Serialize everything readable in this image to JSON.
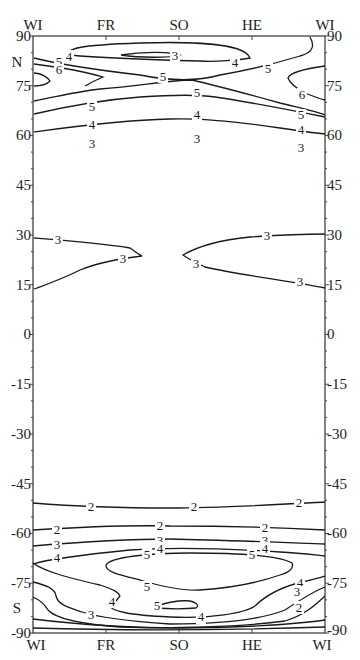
{
  "chart_data": {
    "type": "contour",
    "title": "",
    "xlabel": "",
    "ylabel": "",
    "x_ticks": [
      "WI",
      "FR",
      "SO",
      "HE",
      "WI"
    ],
    "y_ticks": [
      90,
      75,
      60,
      45,
      30,
      15,
      0,
      -15,
      -30,
      -45,
      -60,
      -75,
      -90
    ],
    "y_range": [
      -90,
      90
    ],
    "hemisphere_labels": {
      "north": "N",
      "south": "S"
    },
    "grid": false,
    "contour_levels": [
      2,
      3,
      4,
      5,
      6
    ],
    "contours": [
      {
        "level": 3,
        "region": "north polar closed minimum near SO at ~83N"
      },
      {
        "level": 4,
        "region": "north polar closed loop FR-HE ~80-86N"
      },
      {
        "level": 5,
        "region": "north WI to HE ~82N"
      },
      {
        "level": 6,
        "region": "north WI left ~78N"
      },
      {
        "level": 6,
        "region": "north WI right ~75N"
      },
      {
        "level": 5,
        "region": "north ~70N across year"
      },
      {
        "level": 4,
        "region": "north ~62-66N across year"
      },
      {
        "level": 3,
        "region": "north ~55-59N across year"
      },
      {
        "level": 3,
        "region": "tropical WI-FR 15-30N"
      },
      {
        "level": 3,
        "region": "tropical SO-WI 15-30N"
      },
      {
        "level": 2,
        "region": "south ~-52S across year"
      },
      {
        "level": 2,
        "region": "south ~-59S across year"
      },
      {
        "level": 3,
        "region": "south ~-63S across year"
      },
      {
        "level": 4,
        "region": "south ~-66S across year"
      },
      {
        "level": 5,
        "region": "south polar closed loop ~-70 to -78S"
      },
      {
        "level": 5,
        "region": "south small closed loop near SO ~-83S"
      },
      {
        "level": 4,
        "region": "south ~-78 to -85S"
      },
      {
        "level": 3,
        "region": "south ~-76 to -86S"
      },
      {
        "level": 2,
        "region": "south ~-80 to -88S"
      }
    ]
  },
  "axes": {
    "top_months": [
      "WI",
      "FR",
      "SO",
      "HE",
      "WI"
    ],
    "bottom_months": [
      "WI",
      "FR",
      "SO",
      "HE",
      "WI"
    ],
    "left_ticks": [
      "90",
      "75",
      "60",
      "45",
      "30",
      "15",
      "0",
      "-15",
      "-30",
      "-45",
      "-60",
      "-75",
      "-90"
    ],
    "right_ticks": [
      "90",
      "75",
      "60",
      "45",
      "30",
      "15",
      "0",
      "-15",
      "-30",
      "-45",
      "-60",
      "-75",
      "-90"
    ],
    "north_label": "N",
    "south_label": "S"
  },
  "labels": {
    "n3": "3",
    "n4a": "4",
    "n4b": "4",
    "n5a": "5",
    "n5b": "5",
    "n5c": "5",
    "n6a": "6",
    "n6b": "6",
    "m5a": "5",
    "m5b": "5",
    "m5c": "5",
    "m4a": "4",
    "m4b": "4",
    "m4c": "4",
    "m3a": "3",
    "m3b": "3",
    "m3c": "3",
    "t3a": "3",
    "t3b": "3",
    "t3c": "3",
    "t3d": "3",
    "s2a": "2",
    "s2b": "2",
    "s2c": "2",
    "s2d": "2",
    "s2e": "2",
    "s2f": "2",
    "s3a": "3",
    "s3b": "3",
    "s3c": "3",
    "s4a": "4",
    "s4b": "4",
    "s4c": "4",
    "s5a": "5",
    "s5b": "5",
    "s5c": "5",
    "s5d": "5",
    "s4d": "4",
    "s4e": "4",
    "s4f": "4",
    "s3d": "3",
    "s3e": "3",
    "s2g": "2"
  }
}
